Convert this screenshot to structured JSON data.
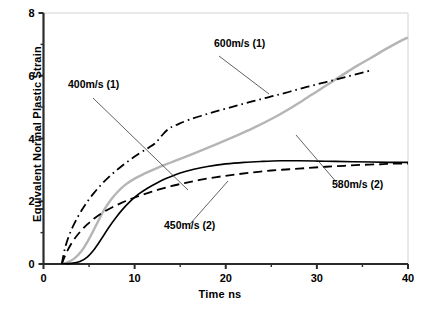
{
  "chart_data": {
    "type": "line",
    "title": "",
    "xlabel": "Time ns",
    "ylabel": "Equivalent Normal Plastic Strain",
    "xlim": [
      0,
      40
    ],
    "ylim": [
      0,
      8
    ],
    "xticks": [
      0,
      10,
      20,
      30,
      40
    ],
    "yticks": [
      0,
      2,
      4,
      6,
      8
    ],
    "xtick_labels": [
      "0",
      "10",
      "20",
      "30",
      "40"
    ],
    "ytick_labels": [
      "0",
      "2",
      "4",
      "6",
      "8"
    ],
    "x_minor_ticks": [
      5,
      15,
      25,
      35
    ],
    "y_minor_ticks": [
      1,
      3,
      5,
      7
    ],
    "grid": false,
    "legend": "annotations",
    "series": [
      {
        "name": "600m/s (1)",
        "style": "dash-dot",
        "color": "#000000",
        "width": 1.8,
        "points": [
          [
            2.0,
            0.0
          ],
          [
            2.4,
            0.55
          ],
          [
            3.0,
            1.05
          ],
          [
            3.8,
            1.52
          ],
          [
            4.6,
            1.9
          ],
          [
            5.5,
            2.25
          ],
          [
            6.5,
            2.58
          ],
          [
            7.5,
            2.86
          ],
          [
            8.5,
            3.1
          ],
          [
            9.5,
            3.32
          ],
          [
            10.5,
            3.52
          ],
          [
            11.5,
            3.7
          ],
          [
            12.3,
            3.86
          ],
          [
            13.0,
            4.1
          ],
          [
            13.8,
            4.32
          ],
          [
            14.8,
            4.46
          ],
          [
            16.0,
            4.6
          ],
          [
            17.5,
            4.74
          ],
          [
            19.0,
            4.87
          ],
          [
            21.0,
            5.03
          ],
          [
            23.0,
            5.19
          ],
          [
            25.0,
            5.34
          ],
          [
            27.0,
            5.49
          ],
          [
            29.0,
            5.65
          ],
          [
            31.0,
            5.8
          ],
          [
            33.0,
            5.95
          ],
          [
            35.0,
            6.1
          ],
          [
            35.8,
            6.16
          ]
        ]
      },
      {
        "name": "580m/s (2)",
        "style": "solid",
        "color": "#b5b5b5",
        "width": 2.4,
        "points": [
          [
            2.0,
            0.0
          ],
          [
            2.6,
            0.05
          ],
          [
            3.4,
            0.18
          ],
          [
            4.2,
            0.42
          ],
          [
            5.0,
            0.8
          ],
          [
            5.8,
            1.25
          ],
          [
            6.6,
            1.7
          ],
          [
            7.4,
            2.05
          ],
          [
            8.2,
            2.32
          ],
          [
            9.0,
            2.53
          ],
          [
            10.0,
            2.72
          ],
          [
            11.0,
            2.87
          ],
          [
            12.0,
            3.0
          ],
          [
            13.5,
            3.18
          ],
          [
            15.0,
            3.35
          ],
          [
            17.0,
            3.58
          ],
          [
            19.0,
            3.82
          ],
          [
            21.0,
            4.07
          ],
          [
            23.0,
            4.33
          ],
          [
            25.0,
            4.62
          ],
          [
            27.0,
            4.95
          ],
          [
            28.5,
            5.22
          ],
          [
            30.0,
            5.5
          ],
          [
            31.5,
            5.78
          ],
          [
            33.0,
            6.06
          ],
          [
            34.5,
            6.33
          ],
          [
            36.0,
            6.58
          ],
          [
            37.5,
            6.84
          ],
          [
            39.0,
            7.08
          ],
          [
            40.0,
            7.22
          ]
        ]
      },
      {
        "name": "400m/s (1)",
        "style": "solid",
        "color": "#000000",
        "width": 1.6,
        "points": [
          [
            2.0,
            0.0
          ],
          [
            3.0,
            0.02
          ],
          [
            4.0,
            0.08
          ],
          [
            4.8,
            0.22
          ],
          [
            5.6,
            0.48
          ],
          [
            6.4,
            0.82
          ],
          [
            7.2,
            1.18
          ],
          [
            8.0,
            1.5
          ],
          [
            8.8,
            1.78
          ],
          [
            9.6,
            2.02
          ],
          [
            10.5,
            2.24
          ],
          [
            11.5,
            2.43
          ],
          [
            12.5,
            2.59
          ],
          [
            13.5,
            2.73
          ],
          [
            15.0,
            2.9
          ],
          [
            16.5,
            3.02
          ],
          [
            18.0,
            3.11
          ],
          [
            20.0,
            3.19
          ],
          [
            22.0,
            3.24
          ],
          [
            24.0,
            3.27
          ],
          [
            26.0,
            3.29
          ],
          [
            28.0,
            3.29
          ],
          [
            30.0,
            3.28
          ],
          [
            32.0,
            3.27
          ],
          [
            34.0,
            3.26
          ],
          [
            36.0,
            3.25
          ],
          [
            38.0,
            3.24
          ],
          [
            40.0,
            3.24
          ]
        ]
      },
      {
        "name": "450m/s (2)",
        "style": "dashed",
        "color": "#000000",
        "width": 1.8,
        "points": [
          [
            2.0,
            0.0
          ],
          [
            2.5,
            0.35
          ],
          [
            3.2,
            0.72
          ],
          [
            4.0,
            1.02
          ],
          [
            4.8,
            1.26
          ],
          [
            5.6,
            1.46
          ],
          [
            6.5,
            1.64
          ],
          [
            7.5,
            1.8
          ],
          [
            8.5,
            1.94
          ],
          [
            9.5,
            2.06
          ],
          [
            10.5,
            2.17
          ],
          [
            11.5,
            2.27
          ],
          [
            12.5,
            2.36
          ],
          [
            14.0,
            2.48
          ],
          [
            15.5,
            2.58
          ],
          [
            17.0,
            2.67
          ],
          [
            19.0,
            2.77
          ],
          [
            21.0,
            2.85
          ],
          [
            23.0,
            2.92
          ],
          [
            25.0,
            2.98
          ],
          [
            27.0,
            3.02
          ],
          [
            29.0,
            3.06
          ],
          [
            31.0,
            3.1
          ],
          [
            33.0,
            3.13
          ],
          [
            35.0,
            3.16
          ],
          [
            37.0,
            3.18
          ],
          [
            38.5,
            3.2
          ],
          [
            40.0,
            3.2
          ]
        ]
      }
    ],
    "annotations": [
      {
        "text": "600m/s (1)",
        "label_x": 214,
        "label_y": 47,
        "leader_from_x": 219,
        "leader_from_y": 56,
        "leader_to_x": 269,
        "leader_to_y": 94
      },
      {
        "text": "400m/s (1)",
        "label_x": 68,
        "label_y": 88,
        "leader_from_x": 93,
        "leader_from_y": 98,
        "leader_to_x": 188,
        "leader_to_y": 190
      },
      {
        "text": "450m/s (2)",
        "label_x": 164,
        "label_y": 229,
        "leader_from_x": 190,
        "leader_from_y": 224,
        "leader_to_x": 228,
        "leader_to_y": 181
      },
      {
        "text": "580m/s (2)",
        "label_x": 332,
        "label_y": 188,
        "leader_from_x": 338,
        "leader_from_y": 184,
        "leader_to_x": 296,
        "leader_to_y": 135
      }
    ]
  }
}
